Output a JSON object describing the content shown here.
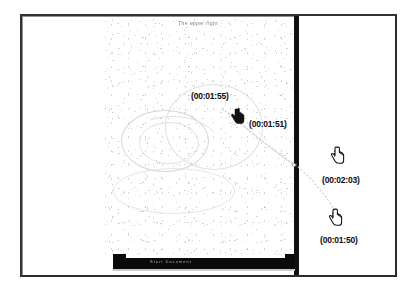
{
  "window": {
    "document_title": "The upper right",
    "taskbar_text": "Start   Document"
  },
  "annotations": {
    "timestamps": [
      {
        "id": "ts-155",
        "label": "(00:01:55)",
        "time": "00:01:55",
        "x": 191,
        "y": 91,
        "panel": "document"
      },
      {
        "id": "ts-151",
        "label": "(00:01:51)",
        "time": "00:01:51",
        "x": 249,
        "y": 119,
        "panel": "document"
      },
      {
        "id": "ts-203",
        "label": "(00:02:03)",
        "time": "00:02:03",
        "x": 322,
        "y": 175,
        "panel": "right"
      },
      {
        "id": "ts-150",
        "label": "(00:01:50)",
        "time": "00:01:50",
        "x": 320,
        "y": 235,
        "panel": "right"
      }
    ],
    "cursors": [
      {
        "id": "cursor-151",
        "icon": "hand-pointer-icon",
        "x": 230,
        "y": 107
      },
      {
        "id": "cursor-203",
        "icon": "hand-pointer-icon",
        "x": 330,
        "y": 146
      },
      {
        "id": "cursor-150",
        "icon": "hand-pointer-icon",
        "x": 328,
        "y": 208
      }
    ],
    "trace_path": {
      "name": "mouse-trace-path",
      "points": [
        [
          222,
          108
        ],
        [
          245,
          128
        ],
        [
          268,
          146
        ],
        [
          292,
          164
        ],
        [
          316,
          186
        ],
        [
          336,
          210
        ]
      ],
      "color": "#c8c8c8"
    }
  },
  "colors": {
    "frame_border": "#2b2b2b",
    "divider": "#111111",
    "taskbar": "#0a0a0a",
    "trace": "#c8c8c8",
    "label_text": "#0c0c0c",
    "page_background": "#ffffff"
  },
  "icons": {
    "hand_pointer": "hand-pointer-icon"
  }
}
